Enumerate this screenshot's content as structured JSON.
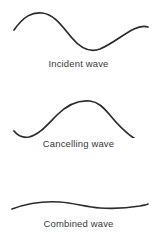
{
  "figure": {
    "background_color": "#ffffff",
    "stroke_color": "#2b2b2b",
    "caption_color": "#3a3a3a"
  },
  "panels": [
    {
      "id": "incident",
      "caption": "Incident wave",
      "wave_name": "incident-wave-curve",
      "path": "M14,30 C24,16 32,12 42,13 C54,14 62,26 72,38 C82,50 92,52 100,49 C112,44 122,35 134,29 C140,26 145,26 148,27"
    },
    {
      "id": "cancelling",
      "caption": "Cancelling wave",
      "wave_name": "cancelling-wave-curve",
      "path": "M14,51 C18,56 23,58 29,57 C39,55 47,45 57,35 C68,24 80,20 90,21 C98,22 103,27 109,34 C118,45 128,55 137,60 C142,62 146,62 148,61"
    },
    {
      "id": "combined",
      "caption": "Combined wave",
      "wave_name": "combined-wave-curve",
      "path": "M12,49 C28,43 44,41 60,42 C74,43 86,47 100,48 C114,49 128,48 140,46 C144,45 147,45 148,44"
    }
  ],
  "chart_data": {
    "type": "line",
    "title": "",
    "subtitle": "",
    "xlabel": "",
    "ylabel": "",
    "grid": false,
    "legend_position": "below-each-panel",
    "x": [
      0,
      0.125,
      0.25,
      0.375,
      0.5,
      0.625,
      0.75,
      0.875,
      1
    ],
    "series": [
      {
        "name": "Incident wave",
        "values": [
          -0.55,
          0.55,
          0.95,
          0.45,
          -0.55,
          -0.95,
          -0.6,
          0.25,
          0.6
        ],
        "phase": "0",
        "amplitude": 1.0
      },
      {
        "name": "Cancelling wave",
        "values": [
          0.55,
          -0.55,
          -0.95,
          -0.45,
          0.55,
          0.95,
          0.6,
          -0.25,
          -0.6
        ],
        "phase": "180",
        "amplitude": 1.0
      },
      {
        "name": "Combined wave",
        "values": [
          0.0,
          0.0,
          0.05,
          0.05,
          0.0,
          -0.05,
          -0.05,
          0.0,
          0.0
        ],
        "phase": "-",
        "amplitude": 0.05
      }
    ]
  }
}
